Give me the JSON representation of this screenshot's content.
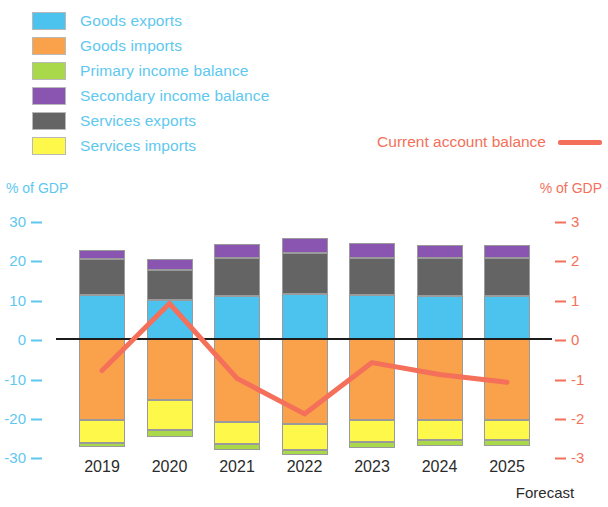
{
  "legend": {
    "items": [
      {
        "label": "Goods exports",
        "key": "goods_exports",
        "color": "#4cc2ef"
      },
      {
        "label": "Goods imports",
        "key": "goods_imports",
        "color": "#f9a14b"
      },
      {
        "label": "Primary income balance",
        "key": "primary_income",
        "color": "#a9d84a"
      },
      {
        "label": "Secondary income balance",
        "key": "secondary_income",
        "color": "#8a55b0"
      },
      {
        "label": "Services exports",
        "key": "services_exports",
        "color": "#646464"
      },
      {
        "label": "Services imports",
        "key": "services_imports",
        "color": "#fdf84a"
      }
    ],
    "line_label": "Current account balance",
    "line_color": "#f4705a",
    "text_color": "#5ec8ef"
  },
  "axes": {
    "left_title": "% of GDP",
    "right_title": "% of GDP",
    "left_ticks": [
      "30",
      "20",
      "10",
      "0",
      "-10",
      "-20",
      "-30"
    ],
    "right_ticks": [
      "3",
      "2",
      "1",
      "0",
      "-1",
      "-2",
      "-3"
    ],
    "left_color": "#5ec8ef",
    "right_color": "#f4705a"
  },
  "footnote": "Forecast",
  "chart_data": {
    "type": "bar",
    "title": "",
    "subtitle": "",
    "xlabel": "",
    "ylabel": "% of GDP",
    "ylabel_right": "% of GDP",
    "ylim": [
      -30,
      30
    ],
    "ylim_right": [
      -3,
      3
    ],
    "grid": false,
    "legend_position": "top-left",
    "stacked": true,
    "categories": [
      "2019",
      "2020",
      "2021",
      "2022",
      "2023",
      "2024",
      "2025"
    ],
    "annotations": [
      "Forecast applies to 2025"
    ],
    "series": [
      {
        "name": "Goods exports",
        "axis": "left",
        "values": [
          11.1,
          9.9,
          10.9,
          11.4,
          11.1,
          10.9,
          10.9
        ]
      },
      {
        "name": "Services exports",
        "axis": "left",
        "values": [
          9.1,
          7.6,
          9.6,
          10.4,
          9.4,
          9.6,
          9.6
        ]
      },
      {
        "name": "Secondary income balance",
        "axis": "left",
        "values": [
          2.3,
          2.8,
          3.5,
          3.8,
          3.8,
          3.3,
          3.3
        ]
      },
      {
        "name": "Goods imports",
        "axis": "left",
        "values": [
          -20.5,
          -15.4,
          -21.0,
          -21.5,
          -20.5,
          -20.5,
          -20.5
        ]
      },
      {
        "name": "Services imports",
        "axis": "left",
        "values": [
          -5.8,
          -7.6,
          -5.6,
          -6.6,
          -5.6,
          -5.1,
          -5.1
        ]
      },
      {
        "name": "Primary income balance",
        "axis": "left",
        "values": [
          -1.0,
          -1.8,
          -1.5,
          -1.3,
          -1.5,
          -1.5,
          -1.5
        ]
      },
      {
        "name": "Current account balance",
        "axis": "right",
        "type": "line",
        "color": "#f4705a",
        "values": [
          -0.8,
          0.9,
          -1.0,
          -1.9,
          -0.6,
          -0.9,
          -1.1
        ]
      }
    ]
  }
}
